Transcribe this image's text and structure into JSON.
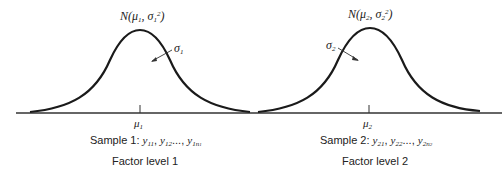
{
  "diagram": {
    "populations": [
      {
        "id": 1,
        "distribution_label": {
          "prefix": "N(",
          "mu": "μ",
          "mu_sub": "1",
          "sep": ", ",
          "sigma": "σ",
          "sigma_sub": "1",
          "sigma_sup": "2",
          "suffix": ")"
        },
        "sd_label": {
          "sym": "σ",
          "sub": "1"
        },
        "mean_label": {
          "sym": "μ",
          "sub": "1"
        },
        "sample_label": {
          "text": "Sample 1: ",
          "items": [
            {
              "sym": "y",
              "sub": "11"
            },
            {
              "sym": "y",
              "sub": "12"
            },
            {
              "sym": "y",
              "sub": "1n",
              "subsub": "1"
            }
          ],
          "ellipsis": "...,"
        },
        "factor_label": "Factor level 1"
      },
      {
        "id": 2,
        "distribution_label": {
          "prefix": "N(",
          "mu": "μ",
          "mu_sub": "2",
          "sep": ", ",
          "sigma": "σ",
          "sigma_sub": "2",
          "sigma_sup": "2",
          "suffix": ")"
        },
        "sd_label": {
          "sym": "σ",
          "sub": "2"
        },
        "mean_label": {
          "sym": "μ",
          "sub": "2"
        },
        "sample_label": {
          "text": "Sample 2: ",
          "items": [
            {
              "sym": "y",
              "sub": "21"
            },
            {
              "sym": "y",
              "sub": "22"
            },
            {
              "sym": "y",
              "sub": "2n",
              "subsub": "2"
            }
          ],
          "ellipsis": "...,"
        },
        "factor_label": "Factor level 2"
      }
    ],
    "colors": {
      "line": "#1a1a1a",
      "text": "#222222",
      "background": "#ffffff"
    }
  }
}
